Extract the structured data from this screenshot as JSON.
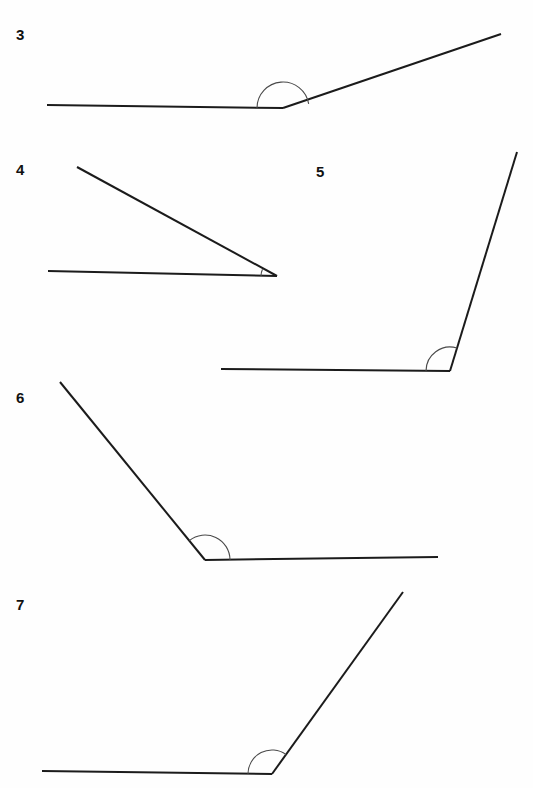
{
  "page": {
    "background_color": "#fefefe",
    "width": 533,
    "height": 788,
    "line_color": "#1b1b1b",
    "arc_color": "#4a4a4a",
    "label_color": "#111111"
  },
  "figures": [
    {
      "id": "figure-3",
      "label": "3",
      "label_pos": {
        "x": 16,
        "y": 40
      },
      "vertex": {
        "x": 283,
        "y": 108
      },
      "rays": [
        {
          "name": "horizontal-left-ray",
          "x2": 47,
          "y2": 105
        },
        {
          "name": "upper-right-ray",
          "x2": 501,
          "y2": 34
        }
      ],
      "arc": {
        "radius": 26,
        "start_angle": 180,
        "end_angle": 9,
        "sweep": "over"
      },
      "angle_type": "obtuse",
      "approx_degrees": 171
    },
    {
      "id": "figure-4",
      "label": "4",
      "label_pos": {
        "x": 16,
        "y": 175
      },
      "vertex": {
        "x": 277,
        "y": 276
      },
      "rays": [
        {
          "name": "horizontal-left-ray",
          "x2": 48,
          "y2": 271
        },
        {
          "name": "upper-left-ray",
          "x2": 77,
          "y2": 167
        }
      ],
      "arc": {
        "radius": 16,
        "start_angle": 180,
        "end_angle": 155,
        "sweep": "over"
      },
      "angle_type": "acute",
      "approx_degrees": 25
    },
    {
      "id": "figure-5",
      "label": "5",
      "label_pos": {
        "x": 316,
        "y": 177
      },
      "vertex": {
        "x": 450,
        "y": 371
      },
      "rays": [
        {
          "name": "horizontal-left-ray",
          "x2": 221,
          "y2": 369
        },
        {
          "name": "upper-right-ray",
          "x2": 517,
          "y2": 152
        }
      ],
      "arc": {
        "radius": 24,
        "start_angle": 180,
        "end_angle": 73,
        "sweep": "over"
      },
      "angle_type": "obtuse",
      "approx_degrees": 107
    },
    {
      "id": "figure-6",
      "label": "6",
      "label_pos": {
        "x": 16,
        "y": 403
      },
      "vertex": {
        "x": 205,
        "y": 560
      },
      "rays": [
        {
          "name": "horizontal-right-ray",
          "x2": 438,
          "y2": 557
        },
        {
          "name": "upper-left-ray",
          "x2": 60,
          "y2": 382
        }
      ],
      "arc": {
        "radius": 25,
        "start_angle": 0,
        "end_angle": 129,
        "sweep": "over"
      },
      "angle_type": "obtuse",
      "approx_degrees": 129
    },
    {
      "id": "figure-7",
      "label": "7",
      "label_pos": {
        "x": 16,
        "y": 610
      },
      "vertex": {
        "x": 272,
        "y": 774
      },
      "rays": [
        {
          "name": "horizontal-left-ray",
          "x2": 42,
          "y2": 771
        },
        {
          "name": "upper-right-ray",
          "x2": 403,
          "y2": 592
        }
      ],
      "arc": {
        "radius": 24,
        "start_angle": 180,
        "end_angle": 54,
        "sweep": "over"
      },
      "angle_type": "obtuse",
      "approx_degrees": 126
    }
  ]
}
